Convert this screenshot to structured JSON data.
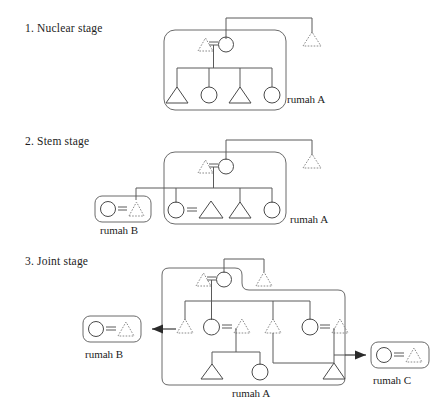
{
  "figure": {
    "title_visible": false,
    "type": "kinship-pedigree-diagram",
    "background_color": "#ffffff",
    "solid_line_color": "#4a4a4a",
    "dashed_line_color": "#8a8a8a",
    "arrow_color": "#2a2a2a"
  },
  "symbol_legend": {
    "circle": "female",
    "triangle": "male",
    "solid_outline": "resident-member",
    "dashed_outline": "non-resident-or-deceased-member",
    "equals_sign": "marriage-union"
  },
  "stages": [
    {
      "id": "stage-1",
      "label": "1. Nuclear stage",
      "houses": [
        {
          "id": "rumah-a-1",
          "label": "rumah A",
          "members": [
            {
              "shape": "triangle",
              "style": "dashed",
              "role": "husband"
            },
            {
              "shape": "circle",
              "style": "solid",
              "role": "wife"
            },
            {
              "shape": "triangle",
              "style": "solid",
              "role": "child-1"
            },
            {
              "shape": "circle",
              "style": "solid",
              "role": "child-2"
            },
            {
              "shape": "triangle",
              "style": "solid",
              "role": "child-3"
            },
            {
              "shape": "circle",
              "style": "solid",
              "role": "child-4"
            }
          ]
        }
      ],
      "outside_members": [
        {
          "shape": "triangle",
          "style": "dashed",
          "role": "sibling-of-wife"
        }
      ],
      "unions": 1,
      "children_count": 4
    },
    {
      "id": "stage-2",
      "label": "2. Stem stage",
      "houses": [
        {
          "id": "rumah-a-2",
          "label": "rumah A",
          "members": [
            {
              "shape": "triangle",
              "style": "dashed",
              "role": "husband"
            },
            {
              "shape": "circle",
              "style": "solid",
              "role": "wife"
            },
            {
              "shape": "circle",
              "style": "solid",
              "role": "daughter-married"
            },
            {
              "shape": "triangle",
              "style": "solid",
              "role": "son-in-law"
            },
            {
              "shape": "triangle",
              "style": "solid",
              "role": "son"
            },
            {
              "shape": "circle",
              "style": "solid",
              "role": "daughter"
            }
          ]
        },
        {
          "id": "rumah-b-2",
          "label": "rumah B",
          "members": [
            {
              "shape": "circle",
              "style": "solid",
              "role": "daughter-moved-out"
            },
            {
              "shape": "triangle",
              "style": "dashed",
              "role": "husband-of-daughter"
            }
          ]
        }
      ],
      "outside_members": [
        {
          "shape": "triangle",
          "style": "dashed",
          "role": "sibling-of-wife"
        }
      ],
      "unions": 3,
      "children_count": 4
    },
    {
      "id": "stage-3",
      "label": "3. Joint stage",
      "houses": [
        {
          "id": "rumah-a-3",
          "label": "rumah A",
          "members": [
            {
              "shape": "triangle",
              "style": "dashed",
              "role": "husband"
            },
            {
              "shape": "circle",
              "style": "solid",
              "role": "wife"
            },
            {
              "shape": "triangle",
              "style": "dashed",
              "role": "brother-in-law"
            },
            {
              "shape": "triangle",
              "style": "dashed",
              "role": "son-1"
            },
            {
              "shape": "circle",
              "style": "solid",
              "role": "daughter-1"
            },
            {
              "shape": "triangle",
              "style": "dashed",
              "role": "son-in-law-1"
            },
            {
              "shape": "triangle",
              "style": "dashed",
              "role": "son-2"
            },
            {
              "shape": "circle",
              "style": "solid",
              "role": "daughter-2"
            },
            {
              "shape": "triangle",
              "style": "dashed",
              "role": "son-in-law-2"
            },
            {
              "shape": "triangle",
              "style": "solid",
              "role": "grandchild-1"
            },
            {
              "shape": "circle",
              "style": "solid",
              "role": "grandchild-2"
            },
            {
              "shape": "triangle",
              "style": "solid",
              "role": "grandchild-3"
            }
          ]
        },
        {
          "id": "rumah-b-3",
          "label": "rumah B",
          "members": [
            {
              "shape": "circle",
              "style": "solid",
              "role": "wife"
            },
            {
              "shape": "triangle",
              "style": "dashed",
              "role": "husband"
            }
          ]
        },
        {
          "id": "rumah-c-3",
          "label": "rumah C",
          "members": [
            {
              "shape": "circle",
              "style": "solid",
              "role": "wife"
            },
            {
              "shape": "triangle",
              "style": "dashed",
              "role": "husband"
            }
          ]
        }
      ],
      "outside_members": [],
      "unions": 5,
      "children_count": 3
    }
  ],
  "labels": {
    "stage_1": "1. Nuclear stage",
    "stage_2": "2. Stem stage",
    "stage_3": "3. Joint stage",
    "rumah_a_1": "rumah A",
    "rumah_a_2": "rumah A",
    "rumah_b_2": "rumah B",
    "rumah_a_3": "rumah A",
    "rumah_b_3": "rumah B",
    "rumah_c_3": "rumah C"
  }
}
